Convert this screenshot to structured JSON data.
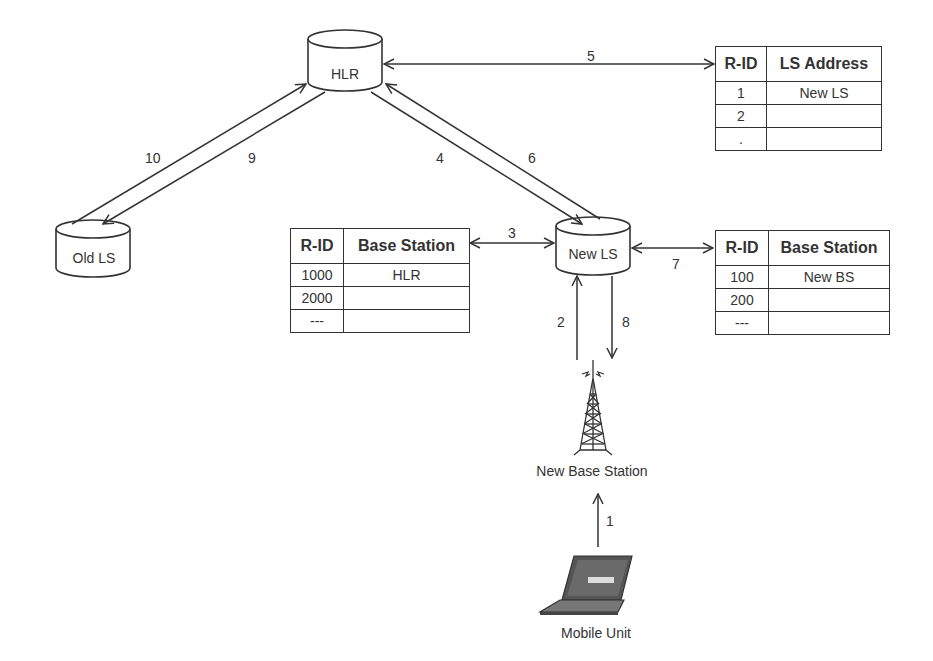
{
  "nodes": {
    "hlr": "HLR",
    "old_ls": "Old LS",
    "new_ls": "New LS",
    "new_base_station": "New Base Station",
    "mobile_unit": "Mobile Unit"
  },
  "arrows": {
    "a1": "1",
    "a2": "2",
    "a3": "3",
    "a4": "4",
    "a5": "5",
    "a6": "6",
    "a7": "7",
    "a8": "8",
    "a9": "9",
    "a10": "10"
  },
  "tables": {
    "hlr_table": {
      "headers": [
        "R-ID",
        "LS Address"
      ],
      "rows": [
        [
          "1",
          "New LS"
        ],
        [
          "2",
          ""
        ],
        [
          ".",
          ""
        ]
      ]
    },
    "new_ls_left_table": {
      "headers": [
        "R-ID",
        "Base Station"
      ],
      "rows": [
        [
          "1000",
          "HLR"
        ],
        [
          "2000",
          ""
        ],
        [
          "---",
          ""
        ]
      ]
    },
    "new_ls_right_table": {
      "headers": [
        "R-ID",
        "Base Station"
      ],
      "rows": [
        [
          "100",
          "New BS"
        ],
        [
          "200",
          ""
        ],
        [
          "---",
          ""
        ]
      ]
    }
  },
  "icons": {
    "hlr": "database-cylinder-icon",
    "old_ls": "database-cylinder-icon",
    "new_ls": "database-cylinder-icon",
    "base_station": "radio-tower-icon",
    "mobile_unit": "laptop-icon"
  }
}
